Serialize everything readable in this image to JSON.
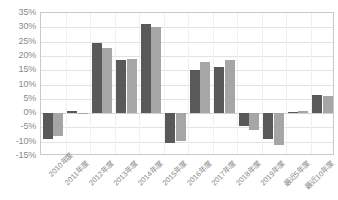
{
  "chart_data": {
    "type": "bar",
    "title": "",
    "xlabel": "",
    "ylabel": "",
    "grid": true,
    "legend_position": "none",
    "ylim": [
      -15,
      35
    ],
    "ytick_step": 5,
    "ytick_labels": [
      "35%",
      "30%",
      "25%",
      "20%",
      "15%",
      "10%",
      "5%",
      "0%",
      "-5%",
      "-10%",
      "-15%"
    ],
    "ytick_values": [
      35,
      30,
      25,
      20,
      15,
      10,
      5,
      0,
      -5,
      -10,
      -15
    ],
    "categories": [
      "2010年度",
      "2011年度",
      "2012年度",
      "2013年度",
      "2014年度",
      "2015年度",
      "2016年度",
      "2017年度",
      "2018年度",
      "2019年度",
      "最近5年度",
      "最近10年度"
    ],
    "series": [
      {
        "name": "series-1",
        "color": "#595959",
        "values": [
          -9.0,
          0.8,
          24.5,
          18.6,
          31.1,
          -10.6,
          15.1,
          16.1,
          -4.4,
          -9.1,
          0.5,
          6.2
        ]
      },
      {
        "name": "series-2",
        "color": "#a6a6a6",
        "values": [
          -8.0,
          0.2,
          22.8,
          19.0,
          30.0,
          -9.8,
          17.9,
          18.4,
          -6.0,
          -11.2,
          0.6,
          6.1
        ]
      }
    ]
  },
  "colors": {
    "series_1": "#595959",
    "series_2": "#a6a6a6",
    "gridline": "#e2e2e2",
    "axis_border": "#c9c9c9",
    "tick_text": "#8a8a8a",
    "background": "#ffffff"
  }
}
